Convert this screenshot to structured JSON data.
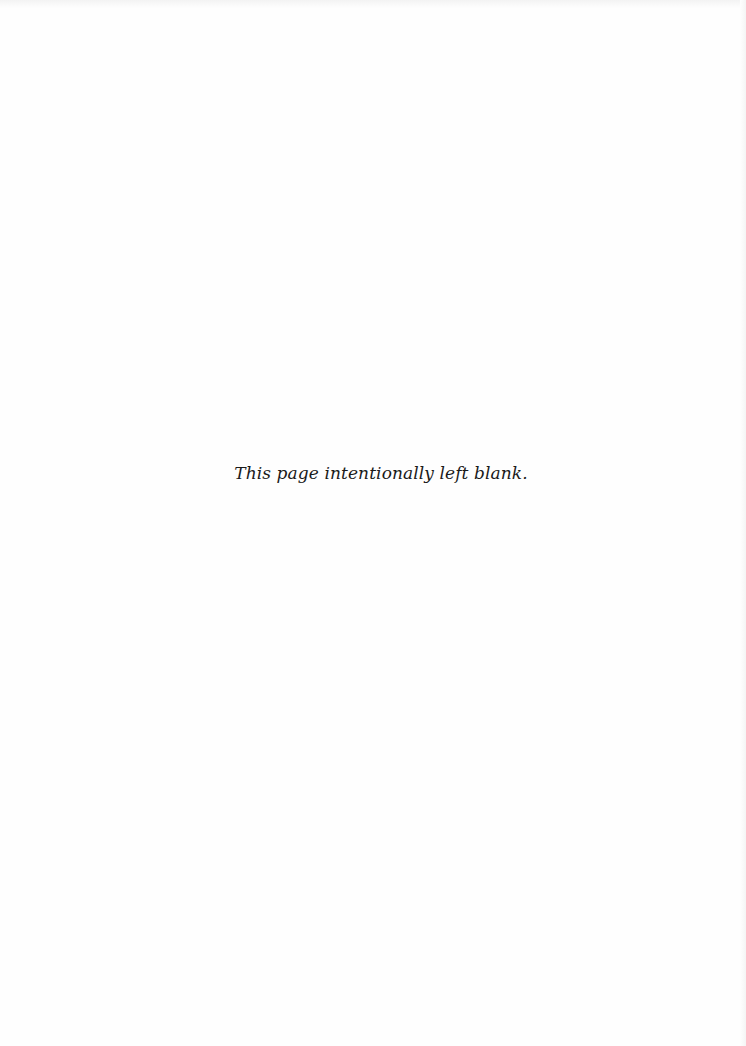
{
  "page": {
    "notice": "This page intentionally left blank."
  }
}
